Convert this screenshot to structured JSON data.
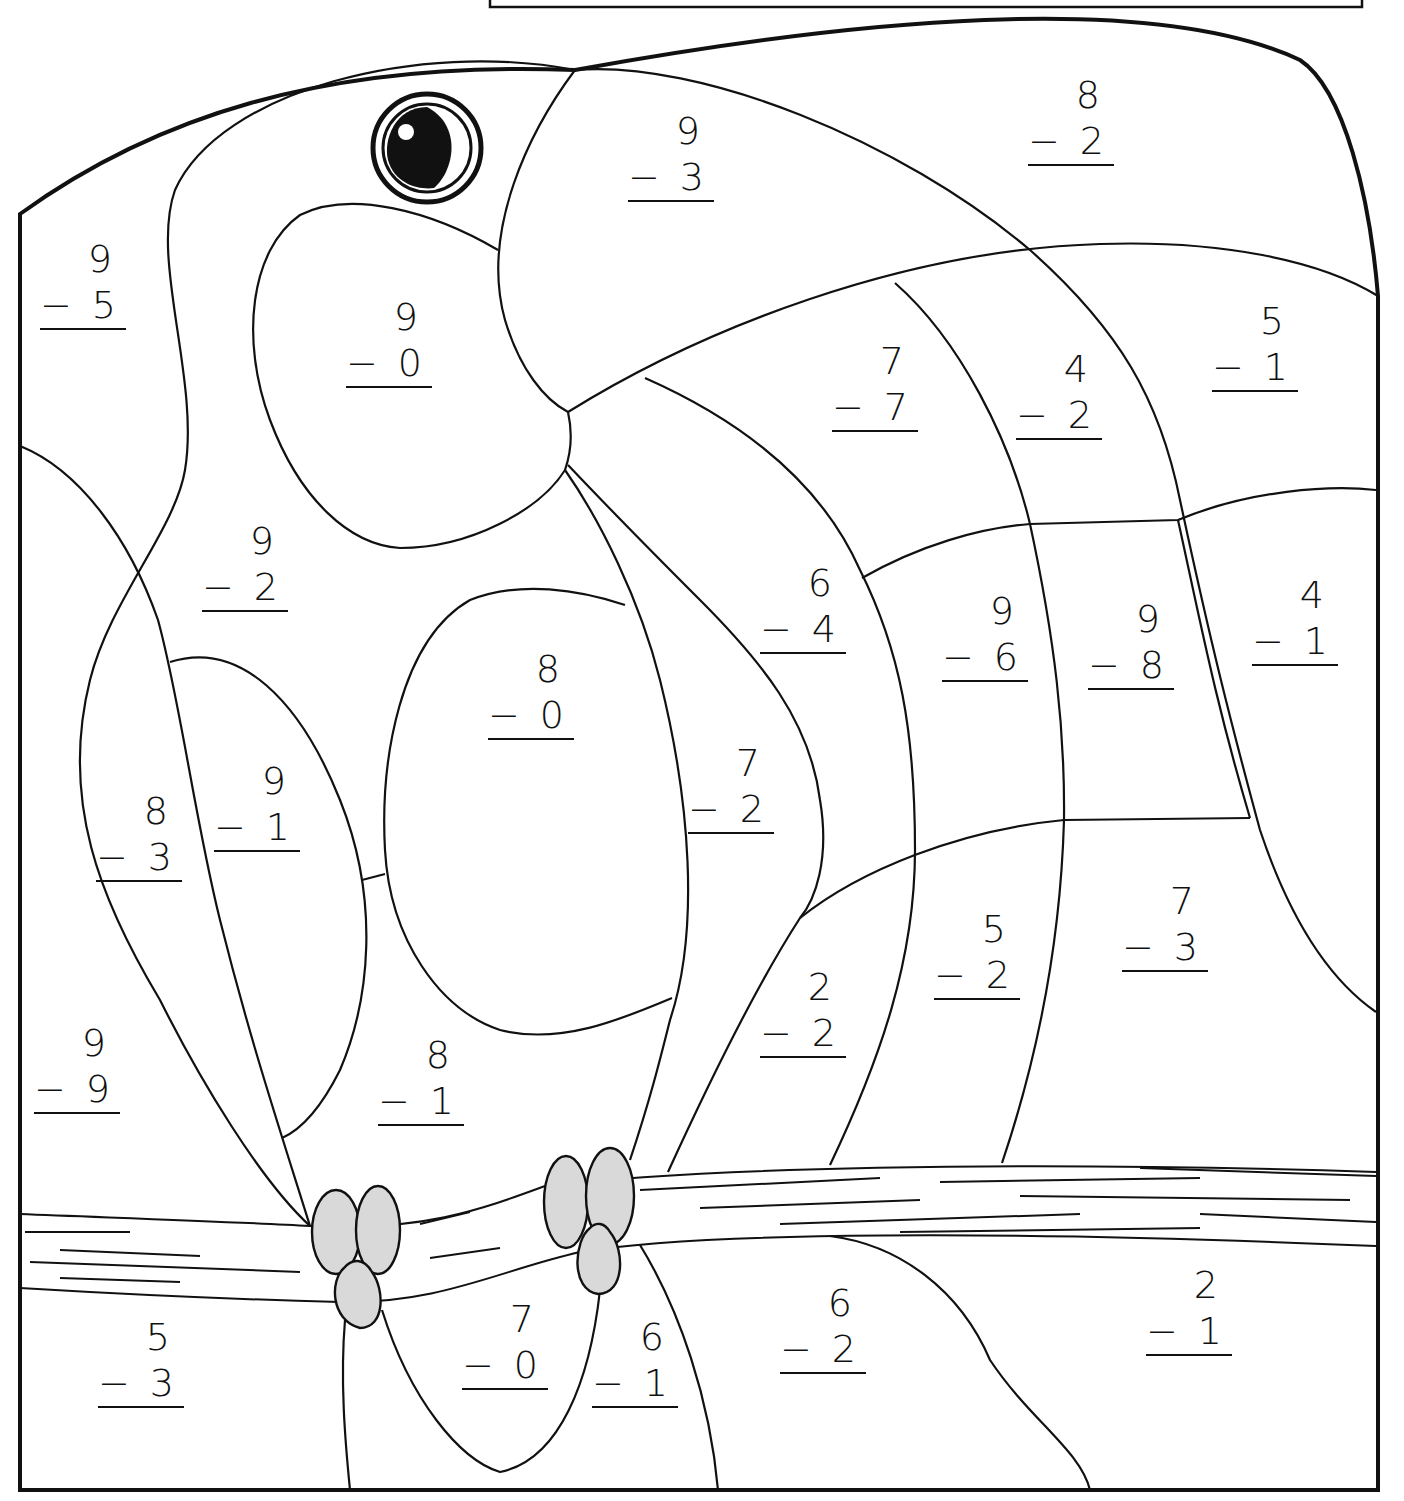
{
  "worksheet": {
    "title_box": "",
    "subject": "Toucan on a branch — subtraction color-by-number",
    "problems": [
      {
        "id": "p1",
        "top": "9",
        "op": "−",
        "bottom": "5",
        "x": 40,
        "y": 236
      },
      {
        "id": "p2",
        "top": "9",
        "op": "−",
        "bottom": "0",
        "x": 346,
        "y": 294
      },
      {
        "id": "p3",
        "top": "9",
        "op": "−",
        "bottom": "3",
        "x": 628,
        "y": 108
      },
      {
        "id": "p4",
        "top": "8",
        "op": "−",
        "bottom": "2",
        "x": 1028,
        "y": 72
      },
      {
        "id": "p5",
        "top": "7",
        "op": "−",
        "bottom": "7",
        "x": 832,
        "y": 338
      },
      {
        "id": "p6",
        "top": "4",
        "op": "−",
        "bottom": "2",
        "x": 1016,
        "y": 346
      },
      {
        "id": "p7",
        "top": "5",
        "op": "−",
        "bottom": "1",
        "x": 1212,
        "y": 298
      },
      {
        "id": "p8",
        "top": "9",
        "op": "−",
        "bottom": "2",
        "x": 202,
        "y": 518
      },
      {
        "id": "p9",
        "top": "6",
        "op": "−",
        "bottom": "4",
        "x": 760,
        "y": 560
      },
      {
        "id": "p10",
        "top": "9",
        "op": "−",
        "bottom": "6",
        "x": 942,
        "y": 588
      },
      {
        "id": "p11",
        "top": "9",
        "op": "−",
        "bottom": "8",
        "x": 1088,
        "y": 596
      },
      {
        "id": "p12",
        "top": "4",
        "op": "−",
        "bottom": "1",
        "x": 1252,
        "y": 572
      },
      {
        "id": "p13",
        "top": "8",
        "op": "−",
        "bottom": "0",
        "x": 488,
        "y": 646
      },
      {
        "id": "p14",
        "top": "7",
        "op": "−",
        "bottom": "2",
        "x": 688,
        "y": 740
      },
      {
        "id": "p15",
        "top": "8",
        "op": "−",
        "bottom": "3",
        "x": 96,
        "y": 788
      },
      {
        "id": "p16",
        "top": "9",
        "op": "−",
        "bottom": "1",
        "x": 214,
        "y": 758
      },
      {
        "id": "p17",
        "top": "5",
        "op": "−",
        "bottom": "2",
        "x": 934,
        "y": 906
      },
      {
        "id": "p18",
        "top": "7",
        "op": "−",
        "bottom": "3",
        "x": 1122,
        "y": 878
      },
      {
        "id": "p19",
        "top": "2",
        "op": "−",
        "bottom": "2",
        "x": 760,
        "y": 964
      },
      {
        "id": "p20",
        "top": "9",
        "op": "−",
        "bottom": "9",
        "x": 34,
        "y": 1020
      },
      {
        "id": "p21",
        "top": "8",
        "op": "−",
        "bottom": "1",
        "x": 378,
        "y": 1032
      },
      {
        "id": "p22",
        "top": "5",
        "op": "−",
        "bottom": "3",
        "x": 98,
        "y": 1314
      },
      {
        "id": "p23",
        "top": "7",
        "op": "−",
        "bottom": "0",
        "x": 462,
        "y": 1296
      },
      {
        "id": "p24",
        "top": "6",
        "op": "−",
        "bottom": "1",
        "x": 592,
        "y": 1314
      },
      {
        "id": "p25",
        "top": "6",
        "op": "−",
        "bottom": "2",
        "x": 780,
        "y": 1280
      },
      {
        "id": "p26",
        "top": "2",
        "op": "−",
        "bottom": "1",
        "x": 1146,
        "y": 1262
      }
    ]
  },
  "colors": {
    "line": "#111111",
    "foot_fill": "#d9d9d9",
    "background": "#ffffff"
  }
}
